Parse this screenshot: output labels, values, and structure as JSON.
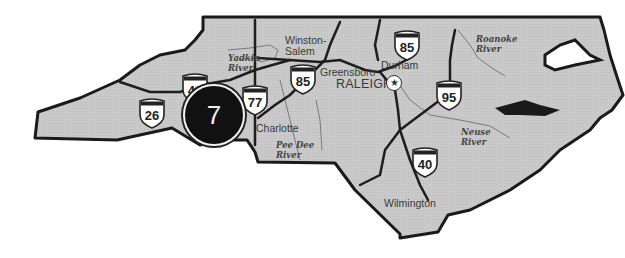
{
  "map": {
    "title": "North Carolina region map",
    "colors": {
      "land": "#c8c8c8",
      "border": "#1a1a1a",
      "roads": "#1e1e1e",
      "rivers": "#7a7a7a",
      "badge": "#111111"
    },
    "region_badge": {
      "number": "7"
    },
    "cities": [
      {
        "name": "Winston-",
        "name2": "Salem"
      },
      {
        "name": "Greensboro"
      },
      {
        "name": "Durham"
      },
      {
        "name": "RALEIGH"
      },
      {
        "name": "Charlotte"
      },
      {
        "name": "Wilmington"
      }
    ],
    "capital_icon": "star-in-circle",
    "rivers": [
      {
        "line1": "Yadkin",
        "line2": "River"
      },
      {
        "line1": "Pee Dee",
        "line2": "River"
      },
      {
        "line1": "Roanoke",
        "line2": "River"
      },
      {
        "line1": "Neuse",
        "line2": "River"
      }
    ],
    "interstates": [
      {
        "number": "26"
      },
      {
        "number": "40"
      },
      {
        "number": "77"
      },
      {
        "number": "85"
      },
      {
        "number": "85"
      },
      {
        "number": "95"
      },
      {
        "number": "40"
      }
    ]
  }
}
